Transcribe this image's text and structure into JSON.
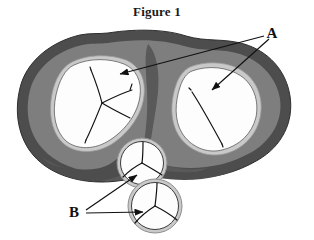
{
  "figure": {
    "title": "Figure 1",
    "type": "anatomical-cross-section-diagram",
    "background_color": "#ffffff"
  },
  "colors": {
    "outer_rim": "#4d4d4d",
    "mid_tissue": "#7e7e7e",
    "inner_septum": "#595959",
    "cavity_fill": "#fdfdfd",
    "cavity_ring": "#c9c9c9",
    "line_stroke": "#111111",
    "label_text": "#111111"
  },
  "labels": [
    {
      "id": "label-a",
      "text": "A",
      "x": 276,
      "y": 38,
      "description": "Label A with two leader arrows pointing to the large left and right cavities"
    },
    {
      "id": "label-b",
      "text": "B",
      "x": 72,
      "y": 216,
      "description": "Label B with two leader arrows pointing to the two small trefoil structures"
    }
  ],
  "structures": {
    "left_cavity": {
      "name": "left-large-cavity",
      "interior": "white",
      "internal_lines": "branching three-way vessel pattern"
    },
    "right_cavity": {
      "name": "right-large-cavity",
      "interior": "white",
      "internal_lines": "single long curved vessel"
    },
    "upper_small_circle": {
      "name": "upper-trefoil-structure",
      "interior": "white",
      "internal_lines": "trefoil / Y-shaped three-part division"
    },
    "lower_small_circle": {
      "name": "lower-trefoil-structure",
      "interior": "white",
      "internal_lines": "trefoil / Y-shaped three-part division"
    }
  },
  "arrows": [
    {
      "id": "arrow-a-left",
      "from_label": "A",
      "points_to": "left-large-cavity",
      "start": [
        262,
        36
      ],
      "end": [
        118,
        75
      ]
    },
    {
      "id": "arrow-a-right",
      "from_label": "A",
      "points_to": "right-large-cavity",
      "start": [
        268,
        38
      ],
      "end": [
        209,
        92
      ]
    },
    {
      "id": "arrow-b-upper",
      "from_label": "B",
      "points_to": "upper-trefoil-structure",
      "start": [
        86,
        211
      ],
      "end": [
        137,
        174
      ]
    },
    {
      "id": "arrow-b-lower",
      "from_label": "B",
      "points_to": "lower-trefoil-structure",
      "start": [
        86,
        213
      ],
      "end": [
        143,
        213
      ]
    }
  ]
}
